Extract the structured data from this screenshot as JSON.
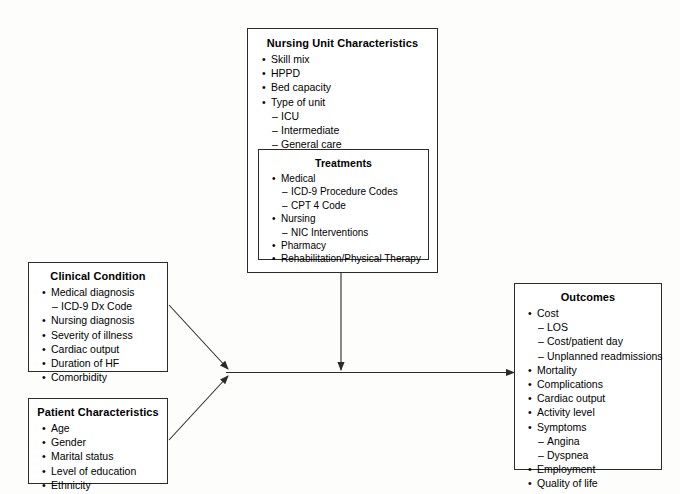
{
  "diagram": {
    "line_color": "#2b2b2b",
    "background_color": "#fdfdfc"
  },
  "boxes": {
    "nursing": {
      "title": "Nursing Unit Characteristics",
      "items": [
        {
          "level": 1,
          "marker": "bullet",
          "text": "Skill mix"
        },
        {
          "level": 1,
          "marker": "bullet",
          "text": "HPPD"
        },
        {
          "level": 1,
          "marker": "bullet",
          "text": "Bed capacity"
        },
        {
          "level": 1,
          "marker": "bullet",
          "text": "Type of unit"
        },
        {
          "level": 2,
          "marker": "dash",
          "text": "ICU"
        },
        {
          "level": 2,
          "marker": "dash",
          "text": "Intermediate"
        },
        {
          "level": 2,
          "marker": "dash",
          "text": "General care"
        }
      ]
    },
    "treatments": {
      "title": "Treatments",
      "items": [
        {
          "level": 1,
          "marker": "bullet",
          "text": "Medical"
        },
        {
          "level": 2,
          "marker": "dash",
          "text": "ICD-9 Procedure Codes"
        },
        {
          "level": 2,
          "marker": "dash",
          "text": "CPT 4 Code"
        },
        {
          "level": 1,
          "marker": "bullet",
          "text": "Nursing"
        },
        {
          "level": 2,
          "marker": "dash",
          "text": "NIC Interventions"
        },
        {
          "level": 1,
          "marker": "bullet",
          "text": "Pharmacy"
        },
        {
          "level": 1,
          "marker": "bullet",
          "text": "Rehabilitation/Physical Therapy"
        }
      ]
    },
    "clinical": {
      "title": "Clinical Condition",
      "items": [
        {
          "level": 1,
          "marker": "bullet",
          "text": "Medical diagnosis"
        },
        {
          "level": 2,
          "marker": "dash",
          "text": "ICD-9 Dx Code"
        },
        {
          "level": 1,
          "marker": "bullet",
          "text": "Nursing diagnosis"
        },
        {
          "level": 1,
          "marker": "bullet",
          "text": "Severity of illness"
        },
        {
          "level": 1,
          "marker": "bullet",
          "text": "Cardiac output"
        },
        {
          "level": 1,
          "marker": "bullet",
          "text": "Duration of HF"
        },
        {
          "level": 1,
          "marker": "bullet",
          "text": "Comorbidity"
        }
      ]
    },
    "patient": {
      "title": "Patient Characteristics",
      "items": [
        {
          "level": 1,
          "marker": "bullet",
          "text": "Age"
        },
        {
          "level": 1,
          "marker": "bullet",
          "text": "Gender"
        },
        {
          "level": 1,
          "marker": "bullet",
          "text": "Marital status"
        },
        {
          "level": 1,
          "marker": "bullet",
          "text": "Level of education"
        },
        {
          "level": 1,
          "marker": "bullet",
          "text": "Ethnicity"
        }
      ]
    },
    "outcomes": {
      "title": "Outcomes",
      "items": [
        {
          "level": 1,
          "marker": "bullet",
          "text": "Cost"
        },
        {
          "level": 2,
          "marker": "dash",
          "text": "LOS"
        },
        {
          "level": 2,
          "marker": "dash",
          "text": "Cost/patient day"
        },
        {
          "level": 2,
          "marker": "dash",
          "text": "Unplanned readmissions"
        },
        {
          "level": 1,
          "marker": "bullet",
          "text": "Mortality"
        },
        {
          "level": 1,
          "marker": "bullet",
          "text": "Complications"
        },
        {
          "level": 1,
          "marker": "bullet",
          "text": "Cardiac output"
        },
        {
          "level": 1,
          "marker": "bullet",
          "text": "Activity level"
        },
        {
          "level": 1,
          "marker": "bullet",
          "text": "Symptoms"
        },
        {
          "level": 2,
          "marker": "dash",
          "text": "Angina"
        },
        {
          "level": 2,
          "marker": "dash",
          "text": "Dyspnea"
        },
        {
          "level": 1,
          "marker": "bullet",
          "text": "Employment"
        },
        {
          "level": 1,
          "marker": "bullet",
          "text": "Quality of life"
        }
      ]
    }
  },
  "connectors": [
    {
      "name": "clinical-to-junction",
      "from": "clinical",
      "to": "junction"
    },
    {
      "name": "patient-to-junction",
      "from": "patient",
      "to": "junction"
    },
    {
      "name": "nursing-to-main-path",
      "from": "nursing",
      "to": "main-path"
    },
    {
      "name": "junction-to-outcomes",
      "from": "junction",
      "to": "outcomes"
    }
  ]
}
